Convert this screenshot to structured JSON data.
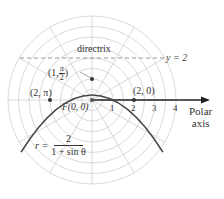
{
  "diagram": {
    "type": "polar-conic",
    "equation": {
      "lhs": "r =",
      "numerator": "2",
      "denominator": "1 + sin θ"
    },
    "directrix": {
      "label": "directrix",
      "equation": "y = 2"
    },
    "focus": {
      "label": "F(0, 0)"
    },
    "points": [
      {
        "label": "(2, π)",
        "r": 2,
        "theta": "π"
      },
      {
        "label_prefix": "(1,",
        "label_num": "π",
        "label_den": "2",
        "label_suffix": ")",
        "r": 1,
        "theta": "π/2"
      },
      {
        "label": "(2, 0)",
        "r": 2,
        "theta": "0"
      }
    ],
    "axis": {
      "label_line1": "Polar",
      "label_line2": "axis",
      "ticks": [
        "1",
        "2",
        "3",
        "4"
      ]
    },
    "colors": {
      "grid": "#c8c8c8",
      "curve": "#444444",
      "axis": "#222222",
      "directrix": "#888888",
      "text": "#333333"
    }
  }
}
